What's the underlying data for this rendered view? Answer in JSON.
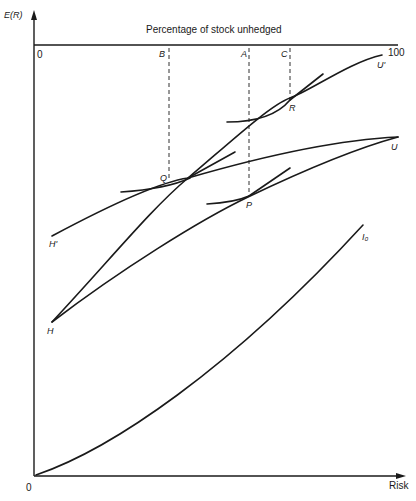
{
  "axes": {
    "y_label": "E(R)",
    "x_label": "Risk",
    "origin": "0",
    "top_axis_title": "Percentage of stock unhedged",
    "top_axis_start": "0",
    "top_axis_end": "100"
  },
  "markers": {
    "B": "B",
    "A": "A",
    "C": "C"
  },
  "points": {
    "Q": "Q",
    "P": "P",
    "R": "R"
  },
  "curves": {
    "U_prime": "U'",
    "U": "U",
    "H_prime": "H'",
    "H": "H",
    "I0": "I₀"
  },
  "colors": {
    "ink": "#1a1a1a",
    "background": "#ffffff"
  }
}
